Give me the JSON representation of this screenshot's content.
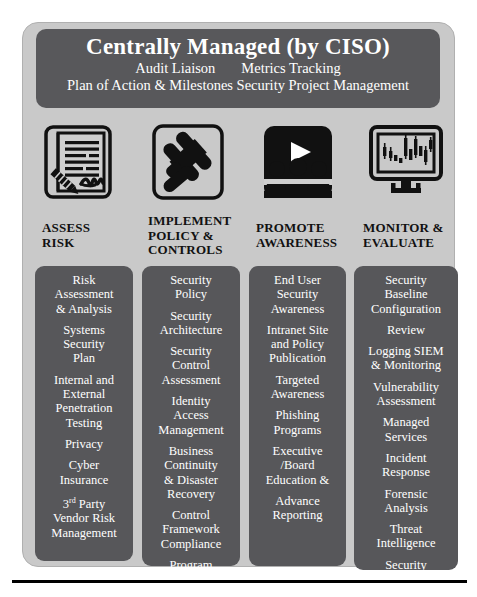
{
  "header": {
    "title": "Centrally Managed (by CISO)",
    "sub_left": "Audit Liaison",
    "sub_right": "Metrics Tracking",
    "sub_line3": "Plan of Action & Milestones Security Project Management"
  },
  "colors": {
    "frame_bg": "#c9c9c9",
    "card_bg": "#57575a",
    "header_bg": "#58585b",
    "text_light": "#ffffff",
    "text_dark": "#111111"
  },
  "columns": [
    {
      "icon": "signed-document-icon",
      "heading": "ASSESS\nRISK",
      "heading_lines": [
        "ASSESS",
        "RISK"
      ],
      "items": [
        "Risk\nAssessment\n& Analysis",
        "Systems\nSecurity\nPlan",
        "Internal and\nExternal\nPenetration\nTesting",
        "Privacy",
        "Cyber\nInsurance",
        "3rd Party\nVendor Risk\nManagement"
      ]
    },
    {
      "icon": "gavel-icon",
      "heading": "IMPLEMENT\nPOLICY &\nCONTROLS",
      "heading_lines": [
        "IMPLEMENT",
        "POLICY &",
        "CONTROLS"
      ],
      "items": [
        "Security\nPolicy",
        "Security\nArchitecture",
        "Security\nControl\nAssessment",
        "Identity\nAccess\nManagement",
        "Business\nContinuity\n& Disaster\nRecovery",
        "Control\nFramework\nCompliance",
        "Program\nManagement"
      ]
    },
    {
      "icon": "presentation-audience-icon",
      "heading": "PROMOTE\nAWARENESS",
      "heading_lines": [
        "PROMOTE",
        "AWARENESS"
      ],
      "items": [
        "End User\nSecurity\nAwareness",
        "Intranet Site\nand Policy\nPublication",
        "Targeted\nAwareness",
        "Phishing\nPrograms",
        "Executive\n/Board\nEducation &",
        "Advance\nReporting"
      ]
    },
    {
      "icon": "monitor-chart-icon",
      "heading": "MONITOR &\nEVALUATE",
      "heading_lines": [
        "MONITOR &",
        "EVALUATE"
      ],
      "items": [
        "Security\nBaseline\nConfiguration",
        "Review",
        "Logging SIEM\n& Monitoring",
        "Vulnerability\nAssessment",
        "Managed\nServices",
        "Incident\nResponse",
        "Forensic\nAnalysis",
        "Threat\nIntelligence",
        "Security\nAnalytics",
        "Insider Threat"
      ]
    }
  ],
  "caption": ""
}
